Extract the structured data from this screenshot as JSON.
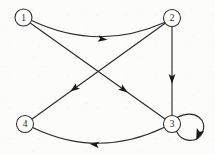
{
  "figure": {
    "kind": "directed-graph",
    "background_color": "#fcfcfb",
    "stroke_color": "#2b2b2b",
    "node_fill": "#ffffff",
    "label_color": "#1d1d1d",
    "width": 215,
    "height": 154
  },
  "nodes": [
    {
      "id": "1",
      "label": "1",
      "cx": 23.5,
      "cy": 17.5,
      "r": 8.5
    },
    {
      "id": "2",
      "label": "2",
      "cx": 172.0,
      "cy": 18.0,
      "r": 8.5
    },
    {
      "id": "3",
      "label": "3",
      "cx": 172.0,
      "cy": 124.0,
      "r": 8.5
    },
    {
      "id": "4",
      "label": "4",
      "cx": 25.0,
      "cy": 124.0,
      "r": 8.5
    }
  ],
  "edges": [
    {
      "id": "e-1-2",
      "from": "1",
      "to": "2",
      "shape": "curved",
      "curve_direction": "bows-down",
      "path": "M 31.6 20.6 Q 98 52 164.5 22.5",
      "arrow": {
        "x": 98,
        "y": 38.5,
        "angle": 8
      }
    },
    {
      "id": "e-1-3",
      "from": "1",
      "to": "3",
      "shape": "straight",
      "path": "M 30.6 23.3 L 165.0 119.0",
      "arrow": {
        "x": 120,
        "y": 87.0,
        "angle": 35.4
      }
    },
    {
      "id": "e-2-4",
      "from": "2",
      "to": "4",
      "shape": "straight",
      "path": "M 165.1 23.2 L 31.8 119.2",
      "arrow": {
        "x": 78,
        "y": 86.0,
        "angle": 144.2
      }
    },
    {
      "id": "e-2-3",
      "from": "2",
      "to": "3",
      "shape": "straight",
      "path": "M 172 26.5 L 172 115.5",
      "arrow": {
        "x": 172,
        "y": 74.0,
        "angle": 90
      }
    },
    {
      "id": "e-3-4",
      "from": "3",
      "to": "4",
      "shape": "curved",
      "curve_direction": "bows-down",
      "path": "M 164.0 127.5 Q 98 159 32.6 127.4",
      "arrow": {
        "x": 99,
        "y": 145.0,
        "angle": 187
      }
    },
    {
      "id": "e-3-3",
      "from": "3",
      "to": "3",
      "shape": "self-loop",
      "curve_direction": "clockwise-right",
      "path": "M 177.4 117.3 C 196 108.5 208 121 202.5 132.5 C 197.5 143.5 181.5 143 176.5 131.3",
      "arrow": {
        "x": 202.0,
        "y": 131.0,
        "angle": 110
      }
    }
  ],
  "adjacency": {
    "1": [
      "2",
      "3"
    ],
    "2": [
      "3",
      "4"
    ],
    "3": [
      "3",
      "4"
    ],
    "4": []
  }
}
